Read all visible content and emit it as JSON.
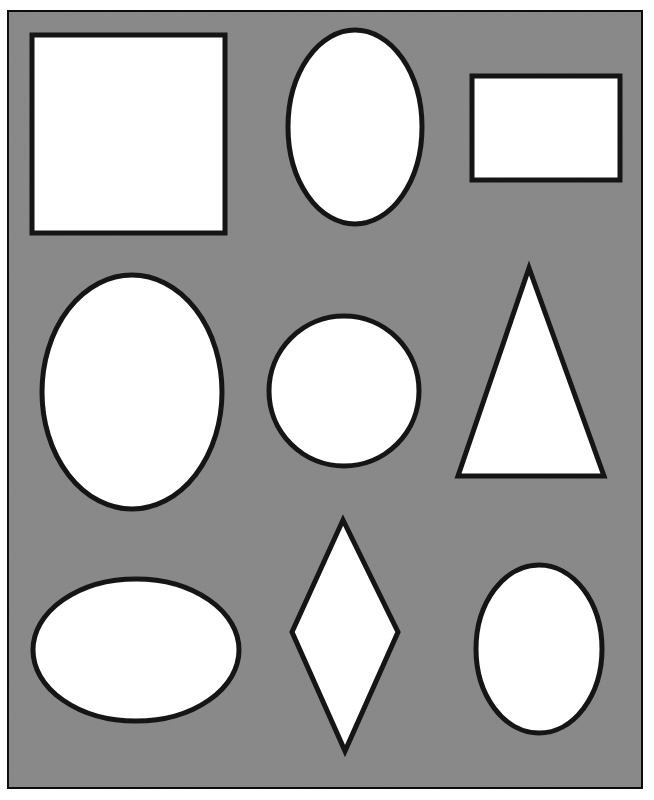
{
  "colors": {
    "page_background": "#ffffff",
    "panel_fill": "#8c8c8c",
    "panel_border": "#111111",
    "shape_fill": "#ffffff",
    "shape_stroke": "#151515"
  },
  "panel": {
    "x": 7,
    "y": 10,
    "width": 636,
    "height": 779,
    "stroke_width": 4
  },
  "shapes": [
    {
      "id": "square",
      "type": "rect",
      "x": 32,
      "y": 35,
      "width": 193,
      "height": 198,
      "stroke_width": 5
    },
    {
      "id": "tall-oval-top",
      "type": "ellipse",
      "cx": 355,
      "cy": 127,
      "rx": 67,
      "ry": 97,
      "stroke_width": 5
    },
    {
      "id": "rectangle",
      "type": "rect",
      "x": 472,
      "y": 76,
      "width": 148,
      "height": 104,
      "stroke_width": 5
    },
    {
      "id": "large-oval",
      "type": "ellipse",
      "cx": 132,
      "cy": 392,
      "rx": 90,
      "ry": 117,
      "stroke_width": 5
    },
    {
      "id": "circle",
      "type": "circle",
      "cx": 344,
      "cy": 391,
      "r": 75,
      "stroke_width": 5
    },
    {
      "id": "triangle",
      "type": "polygon",
      "points": "529,268 458,476 604,476",
      "stroke_width": 5
    },
    {
      "id": "wide-oval",
      "type": "ellipse",
      "cx": 136,
      "cy": 650,
      "rx": 103,
      "ry": 71,
      "stroke_width": 5
    },
    {
      "id": "diamond",
      "type": "polygon",
      "points": "343,520 292,632 398,632 345,751",
      "stroke_width": 5
    },
    {
      "id": "small-oval",
      "type": "ellipse",
      "cx": 539,
      "cy": 649,
      "rx": 63,
      "ry": 84,
      "stroke_width": 5
    }
  ]
}
